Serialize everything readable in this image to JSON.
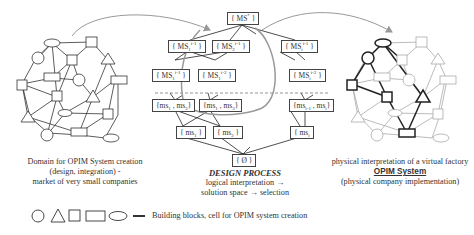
{
  "tree": {
    "root": "{ MS* }",
    "level1": [
      "{ MS1^i-1 }",
      "{ MS2^i-1 }",
      "{ MSi^i-1 }"
    ],
    "level2": [
      "{ MS1^i-1 }",
      "{ MS1^i-2 }",
      "{ MSi^i-2 }"
    ],
    "level3": [
      "{ms1 , ms2}",
      "{ms1 , ms3}",
      "{msi-1 , msi}"
    ],
    "level4": [
      "{ ms1 }",
      "{ ms2 }",
      "{ msi }"
    ],
    "bottom": "{ Ø }"
  },
  "captions": {
    "left_line1": "Domain for OPIM System creation",
    "left_line2": "(design, integration) -",
    "left_line3": "market of very small companies",
    "center_title": "DESIGN PROCESS",
    "center_line1": "logical interpretation →",
    "center_line2": "solution space → selection",
    "right_line1": "physical interpretation of a virtual factory",
    "right_title": "OPIM System",
    "right_line2": "(physical company implementation)"
  },
  "legend": {
    "shapes": [
      "circle",
      "triangle",
      "square",
      "rectangle",
      "ellipse",
      "line"
    ],
    "label": "Building blocks, cell for OPIM system creation"
  },
  "colors": {
    "line": "#333333",
    "grey_line": "#999999",
    "highlight": "#222222",
    "arrow": "#888888"
  }
}
